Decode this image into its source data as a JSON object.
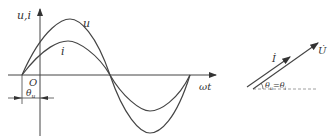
{
  "waveform": {
    "y_axis_label": "u,i",
    "x_axis_label": "ωt",
    "origin_label": "O",
    "phase_label": "θ",
    "phase_sub": "u",
    "curve_u_label": "u",
    "curve_i_label": "i"
  },
  "phasor": {
    "current_label": "İ",
    "voltage_label": "U̇",
    "angle_label": "θ",
    "angle_sub_u": "u",
    "angle_eq": "=θ",
    "angle_sub_i": "i"
  },
  "colors": {
    "line": "#444444",
    "text": "#333333",
    "dashed": "#888888"
  }
}
